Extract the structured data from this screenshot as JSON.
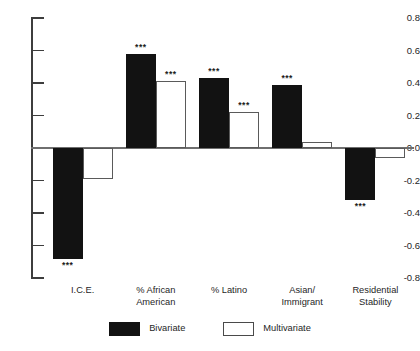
{
  "chart_data": {
    "type": "bar",
    "title": "",
    "subtitle": "",
    "xlabel": "",
    "ylabel": "",
    "ylim": [
      -0.8,
      0.8
    ],
    "grid": false,
    "legend_position": "bottom-center",
    "y_ticks": [
      "0.8",
      "0.6",
      "0.4",
      "0.2",
      "0.0",
      "-0.2",
      "-0.4",
      "-0.6",
      "-0.8"
    ],
    "y_tick_values": [
      0.8,
      0.6,
      0.4,
      0.2,
      0.0,
      -0.2,
      -0.4,
      -0.6,
      -0.8
    ],
    "categories": [
      "I.C.E.",
      "% African\nAmerican",
      "% Latino",
      "Asian/\nImmigrant",
      "Residential\nStability"
    ],
    "series": [
      {
        "name": "Bivariate",
        "color": "#121212",
        "values": [
          -0.68,
          0.58,
          0.43,
          0.39,
          -0.32
        ],
        "annotations": [
          "***",
          "***",
          "***",
          "***",
          "***"
        ]
      },
      {
        "name": "Multivariate",
        "color": "#ffffff",
        "values": [
          -0.19,
          0.41,
          0.22,
          0.04,
          -0.06
        ],
        "annotations": [
          "",
          "***",
          "***",
          "",
          ""
        ]
      }
    ]
  },
  "legend": {
    "items": [
      {
        "label": "Bivariate",
        "style": "bivariate"
      },
      {
        "label": "Multivariate",
        "style": "multivariate"
      }
    ]
  }
}
